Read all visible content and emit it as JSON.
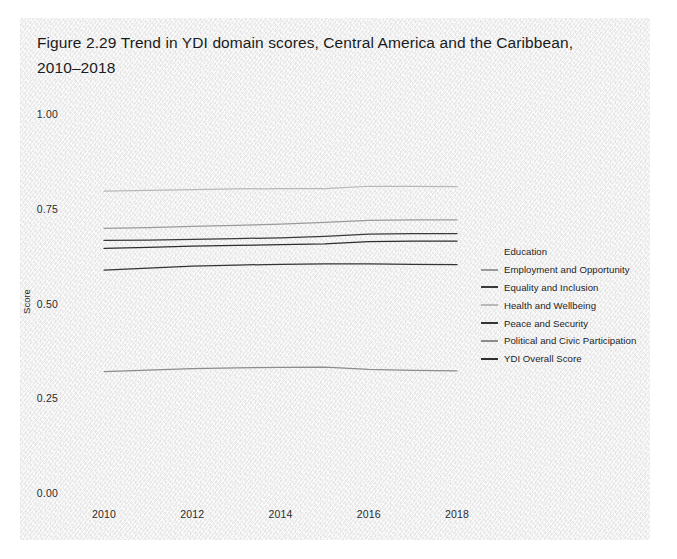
{
  "figure": {
    "title": "Figure 2.29  Trend in YDI domain scores, Central America and the Caribbean,\n2010–2018",
    "panel_color": "#ececed",
    "page_color": "#ffffff"
  },
  "axes": {
    "y_label": "Score",
    "y_ticks": [
      "0.00",
      "0.25",
      "0.50",
      "0.75",
      "1.00"
    ],
    "x_ticks": [
      "2010",
      "2012",
      "2014",
      "2016",
      "2018"
    ]
  },
  "legend": {
    "items": [
      {
        "label": "Education",
        "color": "#f2f2f2"
      },
      {
        "label": "Employment and Opportunity",
        "color": "#9a9a9a"
      },
      {
        "label": "Equality and Inclusion",
        "color": "#3a3a3a"
      },
      {
        "label": "Health and Wellbeing",
        "color": "#b8b8b8"
      },
      {
        "label": "Peace and Security",
        "color": "#343434"
      },
      {
        "label": "Political and Civic Participation",
        "color": "#8c8c8c"
      },
      {
        "label": "YDI Overall Score",
        "color": "#2e2e2e"
      }
    ]
  },
  "chart_data": {
    "type": "line",
    "title": "Figure 2.29  Trend in YDI domain scores, Central America and the Caribbean, 2010–2018",
    "xlabel": "",
    "ylabel": "Score",
    "xlim": [
      2010,
      2018
    ],
    "ylim": [
      0.0,
      1.0
    ],
    "yticks": [
      0.0,
      0.25,
      0.5,
      0.75,
      1.0
    ],
    "xticks": [
      2010,
      2012,
      2014,
      2016,
      2018
    ],
    "grid": false,
    "legend_position": "right",
    "x": [
      2010,
      2011,
      2012,
      2013,
      2014,
      2015,
      2016,
      2017,
      2018
    ],
    "series": [
      {
        "name": "Education",
        "color": "#f2f2f2",
        "values": [
          0.648,
          0.643,
          0.631,
          0.63,
          0.63,
          0.633,
          0.671,
          0.674,
          0.675
        ]
      },
      {
        "name": "Employment and Opportunity",
        "color": "#9a9a9a",
        "values": [
          0.701,
          0.703,
          0.706,
          0.709,
          0.712,
          0.717,
          0.722,
          0.723,
          0.723
        ]
      },
      {
        "name": "Equality and Inclusion",
        "color": "#3a3a3a",
        "values": [
          0.669,
          0.67,
          0.672,
          0.674,
          0.676,
          0.68,
          0.686,
          0.687,
          0.687
        ]
      },
      {
        "name": "Health and Wellbeing",
        "color": "#b8b8b8",
        "values": [
          0.799,
          0.801,
          0.803,
          0.805,
          0.806,
          0.806,
          0.812,
          0.812,
          0.811
        ]
      },
      {
        "name": "Peace and Security",
        "color": "#343434",
        "values": [
          0.591,
          0.596,
          0.601,
          0.604,
          0.606,
          0.607,
          0.607,
          0.606,
          0.605
        ]
      },
      {
        "name": "Political and Civic Participation",
        "color": "#8c8c8c",
        "values": [
          0.323,
          0.327,
          0.331,
          0.333,
          0.334,
          0.335,
          0.329,
          0.326,
          0.325
        ]
      },
      {
        "name": "YDI Overall Score",
        "color": "#2e2e2e",
        "values": [
          0.648,
          0.651,
          0.654,
          0.656,
          0.658,
          0.66,
          0.666,
          0.667,
          0.667
        ]
      }
    ]
  }
}
